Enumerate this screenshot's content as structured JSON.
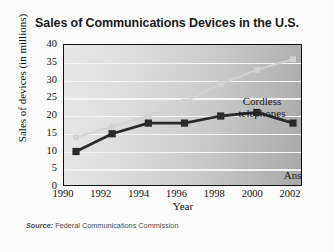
{
  "chart_data": {
    "type": "line",
    "title": "Sales of Communications Devices in the U.S.",
    "xlabel": "Year",
    "ylabel": "Sales of devices (in millions)",
    "source": "Source: Federal Communications Commission",
    "source_prefix": "Source:",
    "source_body": " Federal Communications Commission",
    "x": [
      1990,
      1992,
      1994,
      1996,
      1998,
      2000,
      2002
    ],
    "xticklabels": [
      "1990",
      "1992",
      "1994",
      "1996",
      "1998",
      "2000",
      "2002"
    ],
    "yticks": [
      0,
      5,
      10,
      15,
      20,
      25,
      30,
      35,
      40
    ],
    "yticklabels": [
      "0",
      "5",
      "10",
      "15",
      "20",
      "25",
      "30",
      "35",
      "40"
    ],
    "ylim": [
      0,
      40
    ],
    "xlim": [
      1990,
      2002
    ],
    "grid": true,
    "legend_position": "inline-annotations",
    "series": [
      {
        "name": "Cordless telephones",
        "annotation": "Cordless telephones",
        "annotation_line1": "Cordless",
        "annotation_line2": "telephones",
        "color": "#d2d2d2",
        "marker": "square",
        "values": [
          14,
          17,
          20,
          24,
          29,
          33,
          36
        ]
      },
      {
        "name": "Answering machines",
        "annotation": "Answering machines",
        "annotation_line1": "Answering",
        "annotation_line2": "machines",
        "color": "#2b2b2b",
        "marker": "square",
        "values": [
          10,
          15,
          18,
          18,
          20,
          21,
          18
        ]
      }
    ]
  },
  "figure": {
    "background_color": "#fbfbfb",
    "plot_border_color": "#0f0f0f",
    "gridline_color": "#f4f4f4"
  }
}
